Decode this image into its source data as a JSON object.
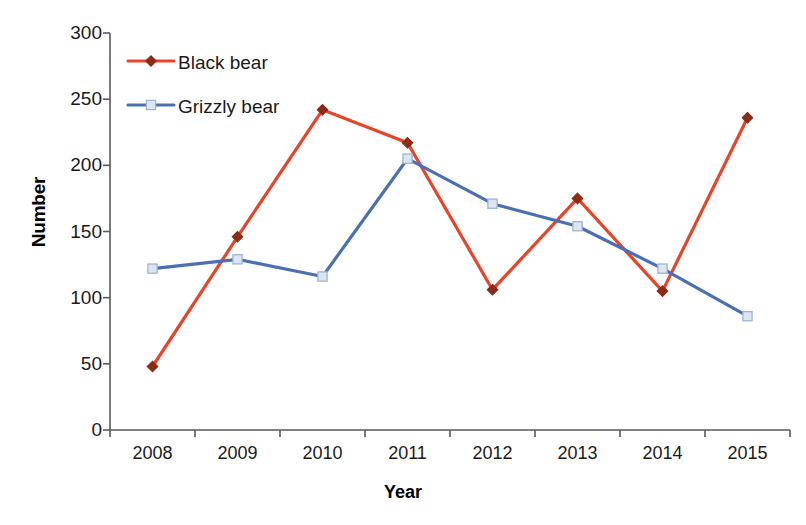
{
  "chart_data": {
    "type": "line",
    "title": "",
    "xlabel": "Year",
    "ylabel": "Number",
    "categories": [
      "2008",
      "2009",
      "2010",
      "2011",
      "2012",
      "2013",
      "2014",
      "2015"
    ],
    "ylim": [
      0,
      300
    ],
    "yticks": [
      0,
      50,
      100,
      150,
      200,
      250,
      300
    ],
    "ytick_labels": [
      "0",
      "50",
      "100",
      "150",
      "200",
      "250",
      "300"
    ],
    "grid": false,
    "legend_position": "top-left",
    "series": [
      {
        "name": "Black bear",
        "color": "#E8442A",
        "marker": "diamond",
        "marker_color": "#8C2B16",
        "values": [
          48,
          146,
          242,
          217,
          106,
          175,
          105,
          236
        ]
      },
      {
        "name": "Grizzly bear",
        "color": "#4A6FB5",
        "marker": "square",
        "marker_color": "#DCE6F2",
        "values": [
          122,
          129,
          116,
          205,
          171,
          154,
          122,
          86
        ]
      }
    ]
  },
  "axes": {
    "axis_color": "#595959",
    "tick_label_color": "#1a1a1a"
  },
  "legend": {
    "entries": [
      {
        "label": "Black bear"
      },
      {
        "label": "Grizzly bear"
      }
    ]
  }
}
